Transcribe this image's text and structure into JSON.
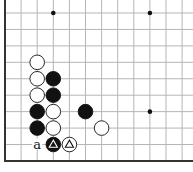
{
  "diagram": {
    "type": "go-board-diagram",
    "region": "lower-left corner",
    "columns": 12,
    "rows": 10,
    "grid_color": "#b5b5b5",
    "edge_color": "#333333",
    "star_points": [
      [
        3,
        0
      ],
      [
        9,
        0
      ],
      [
        9,
        6
      ]
    ],
    "stones": [
      {
        "col": 2,
        "row": 3,
        "color": "white"
      },
      {
        "col": 2,
        "row": 4,
        "color": "white"
      },
      {
        "col": 3,
        "row": 4,
        "color": "black"
      },
      {
        "col": 2,
        "row": 5,
        "color": "white"
      },
      {
        "col": 3,
        "row": 5,
        "color": "black"
      },
      {
        "col": 2,
        "row": 6,
        "color": "black"
      },
      {
        "col": 3,
        "row": 6,
        "color": "white"
      },
      {
        "col": 5,
        "row": 6,
        "color": "black"
      },
      {
        "col": 2,
        "row": 7,
        "color": "black"
      },
      {
        "col": 3,
        "row": 7,
        "color": "white"
      },
      {
        "col": 6,
        "row": 7,
        "color": "white"
      },
      {
        "col": 3,
        "row": 8,
        "color": "black",
        "mark": "triangle"
      },
      {
        "col": 4,
        "row": 8,
        "color": "white",
        "mark": "triangle"
      }
    ],
    "labels": [
      {
        "col": 2,
        "row": 8,
        "text": "a"
      }
    ]
  }
}
